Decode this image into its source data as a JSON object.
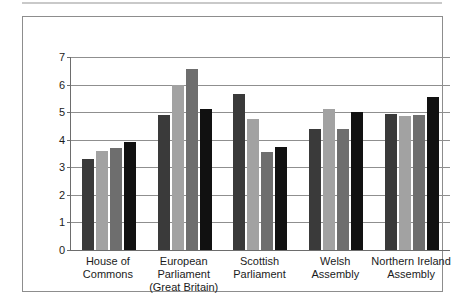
{
  "chart_data": {
    "type": "bar",
    "title": "",
    "subtitle": "",
    "xlabel": "",
    "ylabel": "",
    "ylim": [
      0,
      7
    ],
    "ytick_labels": [
      "0",
      "1",
      "2",
      "3",
      "4",
      "5",
      "6",
      "7"
    ],
    "ytick_values": [
      0,
      1,
      2,
      3,
      4,
      5,
      6,
      7
    ],
    "grid": true,
    "legend": "none",
    "categories": [
      "House of\nCommons",
      "European\nParliament\n(Great Britain)",
      "Scottish\nParliament",
      "Welsh\nAssembly",
      "Northern Ireland\nAssembly"
    ],
    "category_lines": [
      [
        "House of",
        "Commons"
      ],
      [
        "European",
        "Parliament",
        "(Great Britain)"
      ],
      [
        "Scottish",
        "Parliament"
      ],
      [
        "Welsh",
        "Assembly"
      ],
      [
        "Northern Ireland",
        "Assembly"
      ]
    ],
    "series": [
      {
        "name": "series-1",
        "color": "#3a3a3a",
        "values": [
          3.3,
          4.88,
          5.65,
          4.4,
          4.95
        ]
      },
      {
        "name": "series-2",
        "color": "#a2a2a2",
        "values": [
          3.58,
          6.0,
          4.75,
          5.1,
          4.87
        ]
      },
      {
        "name": "series-3",
        "color": "#6e6e6e",
        "values": [
          3.7,
          6.55,
          3.55,
          4.38,
          4.9
        ]
      },
      {
        "name": "series-4",
        "color": "#111111",
        "values": [
          3.93,
          5.13,
          3.73,
          5.0,
          5.55
        ]
      }
    ]
  },
  "colors": {
    "frame": "#8d8d8d",
    "axis": "#6d6d6d",
    "gridline": "#8f8f8f",
    "background": "#ffffff",
    "text": "#1b1b1b"
  }
}
